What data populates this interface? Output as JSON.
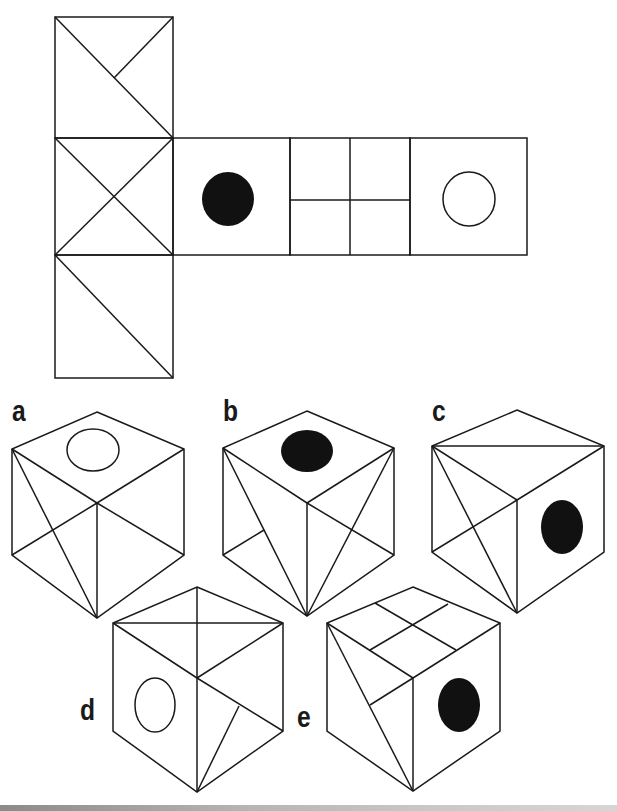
{
  "puzzle": {
    "type": "cube-net folding",
    "question_visible": false
  },
  "colors": {
    "stroke": "#1a1a1a",
    "fill_dot": "#111111",
    "background": "#ffffff"
  },
  "net": {
    "faces": [
      {
        "id": "col-top",
        "pattern": "diagonal-with-branch"
      },
      {
        "id": "col-middle",
        "pattern": "x-cross"
      },
      {
        "id": "col-bottom",
        "pattern": "single-diagonal"
      },
      {
        "id": "row-1",
        "pattern": "filled-circle"
      },
      {
        "id": "row-2",
        "pattern": "four-quadrants"
      },
      {
        "id": "row-3",
        "pattern": "open-circle"
      }
    ]
  },
  "options": [
    {
      "label": "a",
      "top": "open-circle",
      "left": "diagonal+half-x",
      "right": "half-diagonal"
    },
    {
      "label": "b",
      "top": "filled-circle",
      "left": "diagonal+branch",
      "right": "diagonal+cross"
    },
    {
      "label": "c",
      "top": "single-diagonal",
      "left": "x-cross",
      "right": "filled-circle"
    },
    {
      "label": "d",
      "top": "x-cross",
      "left": "open-circle",
      "right": "diagonal-with-branch"
    },
    {
      "label": "e",
      "top": "four-quadrants",
      "left": "diagonal+branch",
      "right": "filled-circle"
    }
  ]
}
